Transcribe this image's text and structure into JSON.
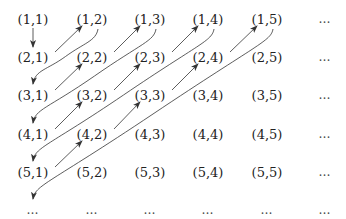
{
  "diagram": {
    "grid": {
      "rows": [
        [
          "(1,1)",
          "(1,2)",
          "(1,3)",
          "(1,4)",
          "(1,5)",
          "…"
        ],
        [
          "(2,1)",
          "(2,2)",
          "(2,3)",
          "(2,4)",
          "(2,5)",
          "…"
        ],
        [
          "(3,1)",
          "(3,2)",
          "(3,3)",
          "(3,4)",
          "(3,5)",
          "…"
        ],
        [
          "(4,1)",
          "(4,2)",
          "(4,3)",
          "(4,4)",
          "(4,5)",
          "…"
        ],
        [
          "(5,1)",
          "(5,2)",
          "(5,3)",
          "(5,4)",
          "(5,5)",
          "…"
        ],
        [
          "…",
          "…",
          "…",
          "…",
          "…",
          "…"
        ]
      ],
      "column_x": [
        33,
        92,
        150,
        208,
        267,
        325
      ],
      "row_y": [
        19,
        57,
        95,
        134,
        172,
        210
      ]
    },
    "arrows": {
      "color": "#333333",
      "down": [
        {
          "from": [
            1,
            1
          ],
          "to": [
            2,
            1
          ]
        }
      ],
      "up_right": [
        {
          "from": [
            2,
            1
          ],
          "to": [
            1,
            2
          ]
        },
        {
          "from": [
            3,
            1
          ],
          "to": [
            2,
            2
          ]
        },
        {
          "from": [
            2,
            2
          ],
          "to": [
            1,
            3
          ]
        },
        {
          "from": [
            4,
            1
          ],
          "to": [
            3,
            2
          ]
        },
        {
          "from": [
            3,
            2
          ],
          "to": [
            2,
            3
          ]
        },
        {
          "from": [
            2,
            3
          ],
          "to": [
            1,
            4
          ]
        },
        {
          "from": [
            5,
            1
          ],
          "to": [
            4,
            2
          ]
        },
        {
          "from": [
            4,
            2
          ],
          "to": [
            3,
            3
          ]
        },
        {
          "from": [
            3,
            3
          ],
          "to": [
            2,
            4
          ]
        },
        {
          "from": [
            2,
            4
          ],
          "to": [
            1,
            5
          ]
        }
      ],
      "curved_down_left": [
        {
          "from": [
            1,
            2
          ],
          "to": [
            3,
            1
          ]
        },
        {
          "from": [
            1,
            3
          ],
          "to": [
            4,
            1
          ]
        },
        {
          "from": [
            1,
            4
          ],
          "to": [
            5,
            1
          ]
        },
        {
          "from": [
            1,
            5
          ],
          "to": [
            6,
            1
          ]
        }
      ]
    }
  }
}
